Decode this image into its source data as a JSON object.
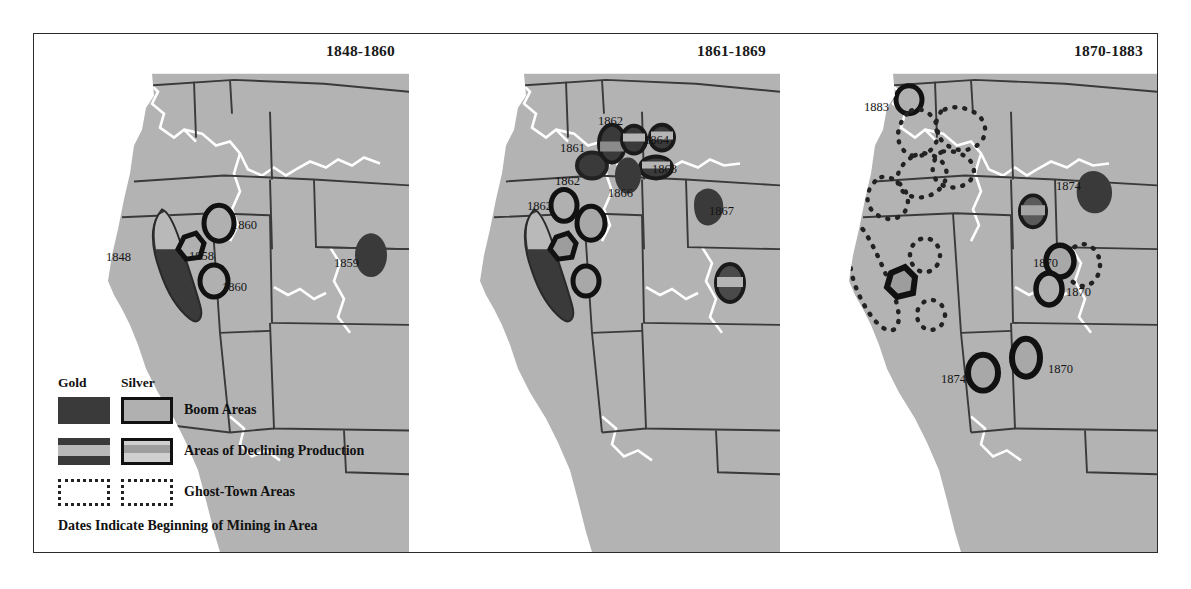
{
  "figure": {
    "panels": [
      {
        "id": "panel-1",
        "title": "1848-1860",
        "date_labels": [
          {
            "text": "1848",
            "x": 72,
            "y": 216
          },
          {
            "text": "1860",
            "x": 198,
            "y": 184
          },
          {
            "text": "1858",
            "x": 155,
            "y": 215
          },
          {
            "text": "1860",
            "x": 188,
            "y": 246
          },
          {
            "text": "1859",
            "x": 300,
            "y": 222
          }
        ]
      },
      {
        "id": "panel-2",
        "title": "1861-1869",
        "date_labels": [
          {
            "text": "1862",
            "x": 186,
            "y": 80
          },
          {
            "text": "1861",
            "x": 148,
            "y": 107
          },
          {
            "text": "1864",
            "x": 232,
            "y": 99
          },
          {
            "text": "1863",
            "x": 240,
            "y": 128
          },
          {
            "text": "1862",
            "x": 143,
            "y": 140
          },
          {
            "text": "1866",
            "x": 196,
            "y": 152
          },
          {
            "text": "1862",
            "x": 115,
            "y": 165
          },
          {
            "text": "1867",
            "x": 297,
            "y": 170
          }
        ]
      },
      {
        "id": "panel-3",
        "title": "1870-1883",
        "date_labels": [
          {
            "text": "1883",
            "x": 81,
            "y": 66
          },
          {
            "text": "1874",
            "x": 273,
            "y": 145
          },
          {
            "text": "1870",
            "x": 250,
            "y": 222
          },
          {
            "text": "1870",
            "x": 283,
            "y": 251
          },
          {
            "text": "1874",
            "x": 158,
            "y": 338
          },
          {
            "text": "1870",
            "x": 265,
            "y": 328
          }
        ]
      }
    ]
  },
  "legend": {
    "heading_gold": "Gold",
    "heading_silver": "Silver",
    "rows": [
      {
        "label": "Boom Areas"
      },
      {
        "label": "Areas of Declining Production"
      },
      {
        "label": "Ghost-Town Areas"
      }
    ],
    "note": "Dates Indicate Beginning of Mining in Area"
  },
  "colors": {
    "land": "#b3b3b3",
    "ocean": "#ffffff",
    "border": "#3a3a3a",
    "river": "#ffffff",
    "gold": "#3a3a3a",
    "silver": "#b0b0b0",
    "marker_outline": "#111111"
  }
}
